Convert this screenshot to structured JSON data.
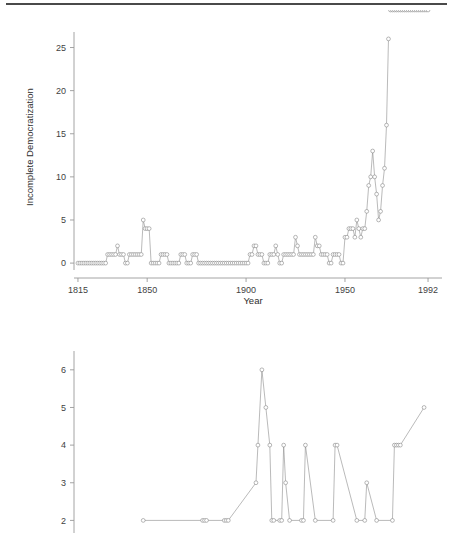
{
  "figure": {
    "top_rule": true,
    "line_color": "#8c8c8c",
    "marker_fill": "#ffffff",
    "marker_stroke": "#7d7d7d",
    "axis_color": "#9a9a9a"
  },
  "panels": [
    {
      "id": "incomplete",
      "ylabel": "Incomplete Democratization",
      "xlabel": "Year",
      "xticks": [
        1815,
        1850,
        1900,
        1950,
        1992
      ],
      "xtick_labels": [
        "1815",
        "1850",
        "1900",
        "1950",
        "1992"
      ],
      "yticks": [
        0,
        5,
        10,
        15,
        20,
        25
      ],
      "ytick_labels": [
        "0",
        "5",
        "10",
        "15",
        "20",
        "25"
      ],
      "xlim": [
        1813,
        1994
      ],
      "ylim": [
        -0.8,
        26.8
      ]
    },
    {
      "id": "complete",
      "ylabel": "Complete Democratization",
      "xlabel": "",
      "xticks": [],
      "xtick_labels": [],
      "yticks": [
        2,
        3,
        4,
        5,
        6
      ],
      "ytick_labels": [
        "2",
        "3",
        "4",
        "5",
        "6"
      ],
      "xlim": [
        1813,
        1994
      ],
      "ylim": [
        1.4,
        6.5
      ]
    }
  ],
  "chart_data": [
    {
      "type": "line",
      "title": "",
      "xlabel": "Year",
      "ylabel": "Incomplete Democratization",
      "xlim": [
        1813,
        1994
      ],
      "ylim": [
        -0.8,
        26.8
      ],
      "grid": false,
      "legend": "none",
      "markers": "open-circle",
      "x": [
        1815,
        1816,
        1817,
        1818,
        1819,
        1820,
        1821,
        1822,
        1823,
        1824,
        1825,
        1826,
        1827,
        1828,
        1829,
        1830,
        1831,
        1832,
        1833,
        1834,
        1835,
        1836,
        1837,
        1838,
        1839,
        1840,
        1841,
        1842,
        1843,
        1844,
        1845,
        1846,
        1847,
        1848,
        1849,
        1850,
        1851,
        1852,
        1853,
        1854,
        1855,
        1856,
        1857,
        1858,
        1859,
        1860,
        1861,
        1862,
        1863,
        1864,
        1865,
        1866,
        1867,
        1868,
        1869,
        1870,
        1871,
        1872,
        1873,
        1874,
        1875,
        1876,
        1877,
        1878,
        1879,
        1880,
        1881,
        1882,
        1883,
        1884,
        1885,
        1886,
        1887,
        1888,
        1889,
        1890,
        1891,
        1892,
        1893,
        1894,
        1895,
        1896,
        1897,
        1898,
        1899,
        1900,
        1901,
        1902,
        1903,
        1904,
        1905,
        1906,
        1907,
        1908,
        1909,
        1910,
        1911,
        1912,
        1913,
        1914,
        1915,
        1916,
        1917,
        1918,
        1919,
        1920,
        1921,
        1922,
        1923,
        1924,
        1925,
        1926,
        1927,
        1928,
        1929,
        1930,
        1931,
        1932,
        1933,
        1934,
        1935,
        1936,
        1937,
        1938,
        1939,
        1940,
        1941,
        1942,
        1943,
        1944,
        1945,
        1946,
        1947,
        1948,
        1949,
        1950,
        1951,
        1952,
        1953,
        1954,
        1955,
        1956,
        1957,
        1958,
        1959,
        1960,
        1961,
        1962,
        1963,
        1964,
        1965,
        1966,
        1967,
        1968,
        1969,
        1970,
        1971,
        1972,
        1973,
        1974,
        1975,
        1976,
        1977,
        1978,
        1979,
        1980,
        1981,
        1982,
        1983,
        1984,
        1985,
        1986,
        1987,
        1988,
        1989,
        1990,
        1991,
        1992
      ],
      "values": [
        0,
        0,
        0,
        0,
        0,
        0,
        0,
        0,
        0,
        0,
        0,
        0,
        0,
        0,
        0,
        1,
        1,
        1,
        1,
        1,
        2,
        1,
        1,
        1,
        0,
        0,
        1,
        1,
        1,
        1,
        1,
        1,
        1,
        5,
        4,
        4,
        4,
        0,
        0,
        0,
        0,
        0,
        1,
        1,
        1,
        1,
        0,
        0,
        0,
        0,
        0,
        0,
        1,
        1,
        1,
        0,
        0,
        0,
        1,
        1,
        1,
        0,
        0,
        0,
        0,
        0,
        0,
        0,
        0,
        0,
        0,
        0,
        0,
        0,
        0,
        0,
        0,
        0,
        0,
        0,
        0,
        0,
        0,
        0,
        0,
        0,
        0,
        1,
        1,
        2,
        2,
        1,
        1,
        1,
        0,
        0,
        0,
        1,
        1,
        1,
        2,
        1,
        0,
        0,
        1,
        1,
        1,
        1,
        1,
        1,
        3,
        2,
        1,
        1,
        1,
        1,
        1,
        1,
        1,
        1,
        3,
        2,
        2,
        1,
        1,
        1,
        1,
        0,
        0,
        1,
        1,
        1,
        1,
        0,
        0,
        3,
        3,
        4,
        4,
        4,
        3,
        5,
        4,
        3,
        4,
        4,
        6,
        9,
        10,
        13,
        10,
        8,
        5,
        6,
        9,
        11,
        16,
        26
      ],
      "notes": "Number of incomplete democratization transitions per year, 1815-1992"
    },
    {
      "type": "line",
      "title": "",
      "xlabel": "",
      "ylabel": "Complete Democratization",
      "xlim": [
        1813,
        1994
      ],
      "ylim": [
        1.4,
        6.5
      ],
      "grid": false,
      "legend": "none",
      "markers": "open-circle",
      "x": [
        1848,
        1878,
        1879,
        1880,
        1889,
        1890,
        1891,
        1905,
        1906,
        1908,
        1910,
        1912,
        1913,
        1914,
        1917,
        1918,
        1919,
        1920,
        1922,
        1928,
        1929,
        1930,
        1935,
        1944,
        1945,
        1946,
        1956,
        1960,
        1961,
        1966,
        1974,
        1975,
        1976,
        1977,
        1978,
        1990
      ],
      "values": [
        2,
        2,
        2,
        2,
        2,
        2,
        2,
        3,
        4,
        6,
        5,
        4,
        2,
        2,
        2,
        2,
        4,
        3,
        2,
        2,
        2,
        4,
        2,
        2,
        4,
        4,
        2,
        2,
        3,
        2,
        2,
        4,
        4,
        4,
        4,
        5
      ],
      "notes": "Number of complete democratization transitions per year; panel is clipped at the bottom of the screenshot"
    }
  ]
}
